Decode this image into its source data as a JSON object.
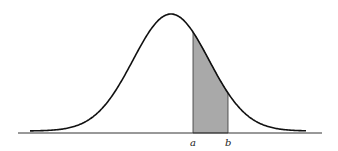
{
  "diagram": {
    "type": "normal-distribution-curve",
    "labels": {
      "a": "a",
      "b": "b"
    },
    "shaded_region": {
      "from": "a",
      "to": "b",
      "fill": "#a9a9a9"
    },
    "colors": {
      "curve": "#111111",
      "axis": "#333333",
      "shade": "#a9a9a9",
      "background": "#ffffff"
    }
  }
}
